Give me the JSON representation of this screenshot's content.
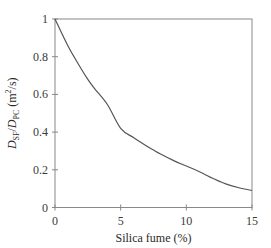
{
  "chart_data": {
    "type": "line",
    "title": "",
    "xlabel": "Silica fume (%)",
    "ylabel_parts": {
      "num_main": "D",
      "num_sub": "SF",
      "slash": "/",
      "den_main": "D",
      "den_sub": "PC",
      "units_open": " (m",
      "units_sup": "2",
      "units_close": "/s)"
    },
    "ylabel": "D_SF/D_PC (m²/s)",
    "xlim": [
      0,
      15
    ],
    "ylim": [
      0,
      1
    ],
    "xticks": [
      0,
      5,
      10,
      15
    ],
    "xtick_labels": [
      "0",
      "5",
      "10",
      "15"
    ],
    "yticks": [
      0,
      0.2,
      0.4,
      0.6,
      0.8,
      1
    ],
    "ytick_labels": [
      "0",
      "0.2",
      "0.4",
      "0.6",
      "0.8",
      "1"
    ],
    "grid": false,
    "legend": null,
    "series": [
      {
        "name": "D_SF/D_PC",
        "color": "#555555",
        "x": [
          0,
          1,
          2,
          2.5,
          3,
          4,
          5,
          6,
          7,
          7.5,
          8,
          9,
          10,
          11,
          12,
          12.5,
          13,
          14,
          15
        ],
        "y": [
          1.0,
          0.855,
          0.735,
          0.68,
          0.632,
          0.545,
          0.42,
          0.37,
          0.325,
          0.305,
          0.285,
          0.25,
          0.22,
          0.19,
          0.155,
          0.14,
          0.125,
          0.105,
          0.09
        ]
      }
    ]
  },
  "layout": {
    "plot_left": 55,
    "plot_right": 252,
    "plot_top": 19,
    "plot_bottom": 207.5,
    "frame_color": "#888888",
    "curve_color": "#555555"
  }
}
